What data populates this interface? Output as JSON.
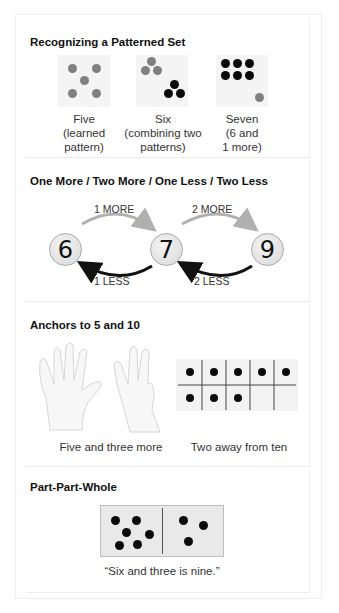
{
  "sections": [
    {
      "title": "Recognizing a Patterned Set",
      "items": [
        {
          "caption_lines": [
            "Five",
            "(learned",
            "pattern)"
          ],
          "gray_dots": 5,
          "black_dots": 0
        },
        {
          "caption_lines": [
            "Six",
            "(combining two",
            "patterns)"
          ],
          "gray_dots": 3,
          "black_dots": 3
        },
        {
          "caption_lines": [
            "Seven",
            "(6 and",
            "1 more)"
          ],
          "gray_dots": 1,
          "black_dots": 6
        }
      ]
    },
    {
      "title": "One More / Two More / One Less / Two Less",
      "numbers": [
        "6",
        "7",
        "9"
      ],
      "arrows": {
        "more_1": "1 MORE",
        "more_2": "2 MORE",
        "less_1": "1 LESS",
        "less_2": "2 LESS"
      }
    },
    {
      "title": "Anchors to 5 and 10",
      "hands_caption": "Five and three more",
      "ten_frame_caption": "Two away from ten",
      "ten_frame": {
        "filled": 8,
        "total": 10
      }
    },
    {
      "title": "Part-Part-Whole",
      "domino": {
        "left": 6,
        "right": 3
      },
      "caption": "“Six and three is nine.”"
    }
  ],
  "colors": {
    "gray_dot": "#808080",
    "black_dot": "#0a0a0a",
    "more_arrow": "#b0b0b0",
    "less_arrow": "#111111",
    "tile_bg": "#f4f4f4"
  }
}
